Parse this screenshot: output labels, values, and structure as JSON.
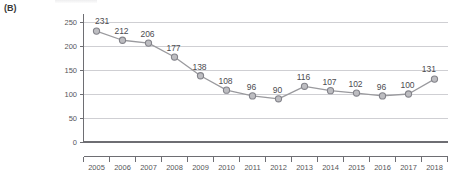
{
  "figure": {
    "panel_label": "(B)"
  },
  "chart_data": {
    "type": "line",
    "title": "",
    "subtitle": "",
    "xlabel": "",
    "ylabel": "",
    "categories": [
      "2005",
      "2006",
      "2007",
      "2008",
      "2009",
      "2010",
      "2011",
      "2012",
      "2013",
      "2014",
      "2015",
      "2016",
      "2017",
      "2018"
    ],
    "values": [
      231,
      212,
      206,
      177,
      138,
      108,
      96,
      90,
      116,
      107,
      102,
      96,
      100,
      131
    ],
    "point_labels": [
      "231",
      "212",
      "206",
      "177",
      "138",
      "108",
      "96",
      "90",
      "116",
      "107",
      "102",
      "96",
      "100",
      "131"
    ],
    "ylim": [
      0,
      250
    ],
    "yticks": [
      0,
      50,
      100,
      150,
      200,
      250
    ],
    "ytick_labels": [
      "0",
      "50",
      "100",
      "150",
      "200",
      "250"
    ],
    "grid": true,
    "grid_axis": "y",
    "legend": false,
    "legend_position": "none",
    "series": [
      {
        "name": "series-1",
        "values": [
          231,
          212,
          206,
          177,
          138,
          108,
          96,
          90,
          116,
          107,
          102,
          96,
          100,
          131
        ],
        "line_color": "#9a9a9e",
        "marker": "circle",
        "marker_fill": "#bdbdc1",
        "marker_edge": "#83838a"
      }
    ],
    "colors": {
      "line": "#9a9a9e",
      "marker_fill": "#bdbdc1",
      "marker_edge": "#83838a",
      "gridline": "#cfcfd3",
      "axis": "#6e6e73",
      "tick_text": "#56565a",
      "label_text": "#4c4c50"
    }
  }
}
